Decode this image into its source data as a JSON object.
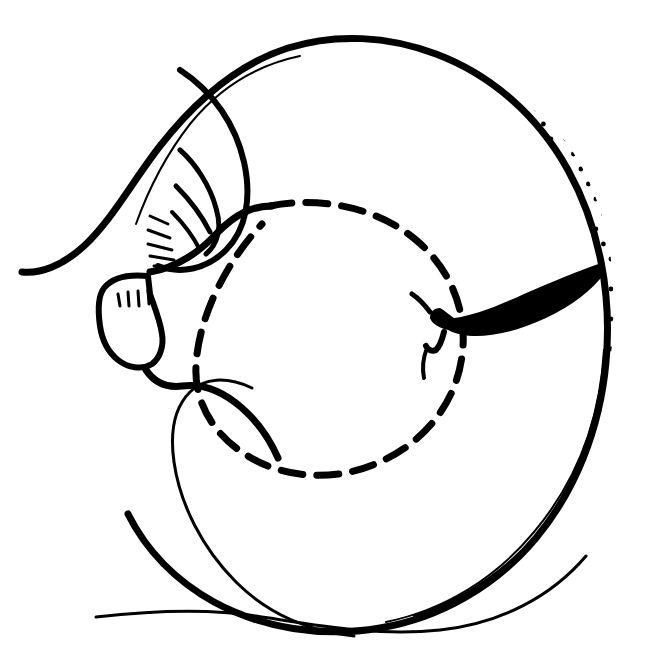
{
  "figure": {
    "kind": "scientific-line-illustration",
    "medium": "pen-and-ink drawing",
    "caption": "",
    "canvas": {
      "width": 653,
      "height": 662,
      "background_color": "#ffffff",
      "ink_color": "#000000"
    },
    "labels": [],
    "scale_bar": null
  },
  "palette": {
    "background": "#ffffff",
    "ink": "#000000",
    "stipple": "#000000"
  },
  "elements": {
    "outer_outline": {
      "name": "shell-outer-outline",
      "description": "Thick continuous spiral body-whorl outline enclosing the shell",
      "stroke_width": 7,
      "path": "M 22 272 C 40 274 62 266 84 246 C 112 220 132 182 160 146 C 196 100 238 64 288 48 C 336 33 388 36 436 54 C 492 75 538 116 568 170 C 600 228 612 296 606 362 C 600 428 576 490 536 538 C 496 586 440 618 380 628 C 322 638 262 628 214 602 C 176 581 146 550 128 514"
    },
    "outer_outline_inner_echo": {
      "name": "shell-outer-outline-inner-echo",
      "description": "Thin inner companion line running just inside the thick outer outline along the upper left and right margin",
      "stroke_width": 2,
      "paths": [
        "M 300 56 C 252 66 216 92 190 124 C 162 160 146 196 136 224",
        "M 604 350 C 600 420 576 482 534 532 C 496 578 444 610 386 622"
      ]
    },
    "spire_whorls": {
      "name": "spire-whorl-curves",
      "description": "Three nested crescent curves marking the inner whorls at the upper-left apex region",
      "strokes": [
        {
          "width": 6,
          "path": "M 180 70 C 214 92 236 126 244 162 C 252 198 246 230 226 250 C 206 270 180 274 158 266"
        },
        {
          "width": 5,
          "path": "M 180 150 C 196 164 210 186 216 208 C 222 228 218 244 206 254"
        },
        {
          "width": 5,
          "path": "M 176 186 C 190 200 202 216 210 232"
        },
        {
          "width": 4,
          "path": "M 172 212 C 184 224 194 238 200 250"
        }
      ]
    },
    "spire_hatch_marks": {
      "name": "spire-hatch-marks",
      "description": "Short radial ridge-hatch ticks beneath the nested whorl curves",
      "count": 5,
      "stroke_width": 3,
      "segments": [
        "M 150 216 L 168 224",
        "M 148 230 L 170 238",
        "M 148 244 L 172 250",
        "M 150 256 L 174 260",
        "M 154 266 L 176 268"
      ]
    },
    "aperture_lip": {
      "name": "aperture-outer-lip",
      "description": "Angular outer lip / columellar shield outline at the left of the shell",
      "stroke_width": 6,
      "path": "M 148 276 C 128 274 112 278 104 288 C 98 296 98 312 100 326 C 102 340 108 352 118 360 C 128 368 142 370 152 364 C 160 358 164 346 162 334 C 160 320 154 306 150 294 Z"
    },
    "aperture_hatch_marks": {
      "name": "aperture-hatch-marks",
      "description": "Four short vertical denticle ticks inside the aperture lip",
      "count": 4,
      "stroke_width": 3,
      "segments": [
        "M 118 294 L 120 306",
        "M 128 292 L 129 306",
        "M 138 291 L 139 306",
        "M 148 290 L 149 304"
      ]
    },
    "columella_curve": {
      "name": "columella-curve",
      "description": "Heavy curve descending from the aperture into the base of the shell",
      "stroke_width": 7,
      "path": "M 146 370 C 154 382 166 388 182 386 C 204 383 224 392 242 408 C 258 422 270 440 278 458"
    },
    "inner_body_curve": {
      "name": "inner-body-whorl-curve",
      "description": "Thin inner curve sweeping from the columella down around the lower-left basal region",
      "stroke_width": 3,
      "path": "M 252 388 C 226 376 204 378 190 392 C 174 408 170 434 174 462 C 180 504 202 548 236 582 C 268 614 310 632 354 636"
    },
    "dashed_boundary": {
      "name": "dashed-aperture-boundary",
      "description": "Heavy dashed oval outlining the inner aperture / body-whorl margin, separating the plain area from the stippled area",
      "stroke_width": 7,
      "dash_pattern": "22 14",
      "path": "M 270 206 C 322 196 378 208 416 240 C 452 270 468 314 462 356 C 456 402 426 440 384 460 C 340 482 286 480 248 456 C 214 436 194 402 196 366 C 198 318 226 262 262 224"
    },
    "black_wedge": {
      "name": "black-wedge-mark",
      "description": "Solid black elongated tapering blade-shaped mark lying across the right-hand stippled field, with a short hook descending at its left end",
      "fill": "#000000",
      "path": "M 604 262 C 580 270 552 282 524 294 C 498 306 472 316 454 318 C 448 314 444 310 440 308 C 434 308 430 312 430 318 C 432 324 440 328 448 330 C 456 334 466 336 476 336 C 496 336 520 330 546 318 C 572 306 592 290 604 274 Z",
      "hook_path": "M 444 332 C 442 340 440 346 436 350 C 432 352 428 350 426 346",
      "tail_path": "M 430 312 C 424 304 418 298 412 294"
    },
    "basal_trailing_line": {
      "name": "basal-trailing-line",
      "description": "Long thin tapering line running along the bottom of the figure, sweeping right to join the shell base",
      "stroke_width": 3,
      "path": "M 96 617 C 150 611 204 608 256 616 C 316 625 378 637 440 630 C 502 623 552 596 586 556"
    },
    "stipple_field": {
      "name": "stipple-shading-field",
      "description": "Regular grid of small round dots shading the outer body whorl between the dashed boundary and the outer outline, covering the right two-thirds of the shell",
      "dot_radius": 2.4,
      "grid_spacing_x": 15,
      "grid_spacing_y": 15,
      "row_offset_x": 7.5,
      "coverage": "annulus between dashed inner boundary and outer shell outline, from upper-left diagonal edge clockwise around to lower-left"
    }
  },
  "annotations": {
    "dot_count_estimate": 1150,
    "line_style": "freehand pen, variable-width"
  }
}
